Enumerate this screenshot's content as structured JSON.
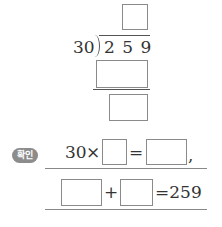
{
  "division": {
    "divisor": "30",
    "dividend": "2 5 9",
    "quotient_box": "",
    "product_box": "",
    "remainder_box": ""
  },
  "check": {
    "badge": "확인",
    "line1": {
      "factor": "30",
      "times": "×",
      "box1": "",
      "equals": "=",
      "box2": "",
      "comma": ","
    },
    "line2": {
      "box1": "",
      "plus": "+",
      "box2": "",
      "equals_result": "=259"
    }
  },
  "colors": {
    "badge_bg": "#8c8c8c",
    "box_border": "#8a8a8a",
    "line": "#888888"
  }
}
